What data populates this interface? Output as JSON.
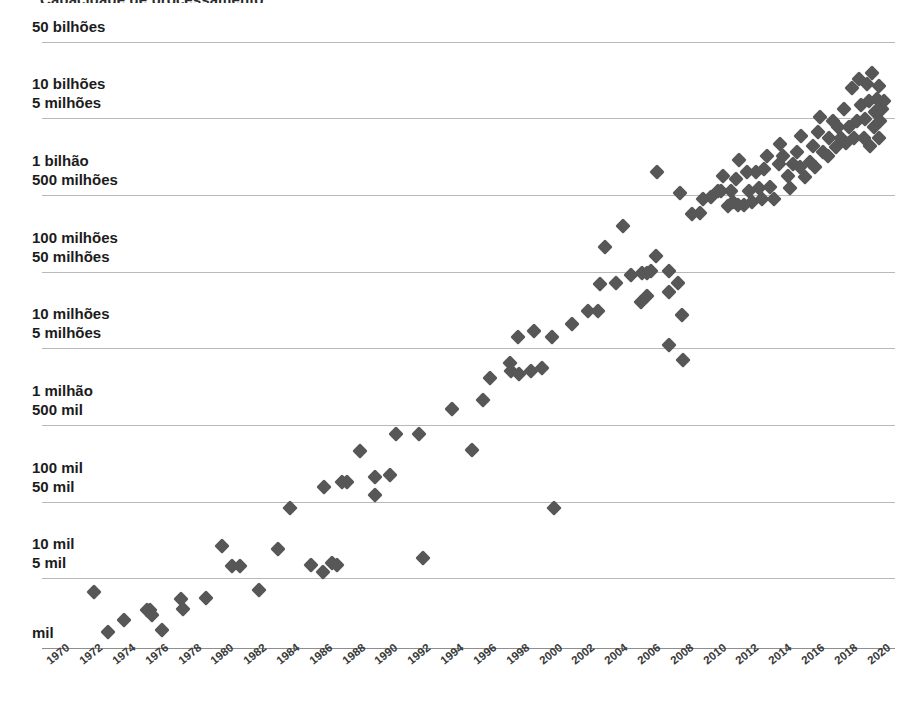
{
  "title": {
    "text": "Capacidade de processamento",
    "note": "partially-cropped-title-at-top-edge"
  },
  "colors": {
    "marker": "#575757",
    "gridline": "#b9b9b9",
    "axis": "#8e8e8e",
    "text": "#1c1c1c",
    "background": "#ffffff"
  },
  "axes": {
    "y_labels": [
      {
        "lines": [
          "50 bilhões"
        ],
        "y": 42
      },
      {
        "lines": [
          "10 bilhões",
          "5 milhões"
        ],
        "y": 118
      },
      {
        "lines": [
          "1 bilhão",
          "500 milhões"
        ],
        "y": 195
      },
      {
        "lines": [
          "100 milhões",
          "50 milhões"
        ],
        "y": 272
      },
      {
        "lines": [
          "10 milhões",
          "5 milhões"
        ],
        "y": 348
      },
      {
        "lines": [
          "1 milhão",
          "500 mil"
        ],
        "y": 425
      },
      {
        "lines": [
          "100 mil",
          "50 mil"
        ],
        "y": 502
      },
      {
        "lines": [
          "10 mil",
          "5 mil"
        ],
        "y": 578
      },
      {
        "lines": [
          "mil"
        ],
        "y": 648
      }
    ],
    "x_labels": [
      "1970",
      "1972",
      "1974",
      "1976",
      "1978",
      "1980",
      "1982",
      "1984",
      "1986",
      "1988",
      "1990",
      "1992",
      "1994",
      "1996",
      "1998",
      "2000",
      "2002",
      "2004",
      "2006",
      "2008",
      "2010",
      "2012",
      "2014",
      "2016",
      "2018",
      "2020"
    ]
  },
  "chart_data": {
    "type": "scatter",
    "title": "Capacidade de processamento",
    "xlabel": "",
    "ylabel": "",
    "log_scale_y": true,
    "xlim": [
      1969,
      2021
    ],
    "ylim": [
      1000,
      50000000000
    ],
    "grid": true,
    "legend": null,
    "y_tick_values": [
      50000000000,
      10000000000,
      1000000000,
      100000000,
      10000000,
      1000000,
      100000,
      10000,
      1000
    ],
    "y_tick_labels": [
      "50 bilhões",
      "10 bilhões / 5 milhões",
      "1 bilhão / 500 milhões",
      "100 milhões / 50 milhões",
      "10 milhões / 5 milhões",
      "1 milhão / 500 mil",
      "100 mil / 50 mil",
      "10 mil / 5 mil",
      "mil"
    ],
    "x_tick_labels": [
      "1970",
      "1972",
      "1974",
      "1976",
      "1978",
      "1980",
      "1982",
      "1984",
      "1986",
      "1988",
      "1990",
      "1992",
      "1994",
      "1996",
      "1998",
      "2000",
      "2002",
      "2004",
      "2006",
      "2008",
      "2010",
      "2012",
      "2014",
      "2016",
      "2018",
      "2020"
    ],
    "points": [
      {
        "x": 1972.2,
        "y": 5200
      },
      {
        "x": 1973.0,
        "y": 1600
      },
      {
        "x": 1974.0,
        "y": 2300
      },
      {
        "x": 1975.4,
        "y": 3000
      },
      {
        "x": 1975.6,
        "y": 3000
      },
      {
        "x": 1975.7,
        "y": 2600
      },
      {
        "x": 1976.3,
        "y": 1700
      },
      {
        "x": 1977.5,
        "y": 4200
      },
      {
        "x": 1977.6,
        "y": 3100
      },
      {
        "x": 1979.0,
        "y": 4300
      },
      {
        "x": 1980.0,
        "y": 20000
      },
      {
        "x": 1980.6,
        "y": 11000
      },
      {
        "x": 1981.1,
        "y": 11000
      },
      {
        "x": 1982.2,
        "y": 5500
      },
      {
        "x": 1983.4,
        "y": 18000
      },
      {
        "x": 1984.1,
        "y": 60000
      },
      {
        "x": 1985.4,
        "y": 11500
      },
      {
        "x": 1986.1,
        "y": 9200
      },
      {
        "x": 1986.7,
        "y": 12000
      },
      {
        "x": 1987.0,
        "y": 11500
      },
      {
        "x": 1986.2,
        "y": 110000
      },
      {
        "x": 1987.3,
        "y": 130000
      },
      {
        "x": 1987.6,
        "y": 130000
      },
      {
        "x": 1989.3,
        "y": 88000
      },
      {
        "x": 1989.3,
        "y": 150000
      },
      {
        "x": 1990.2,
        "y": 160000
      },
      {
        "x": 1988.4,
        "y": 320000
      },
      {
        "x": 1990.6,
        "y": 520000
      },
      {
        "x": 1992.0,
        "y": 530000
      },
      {
        "x": 1992.2,
        "y": 14000
      },
      {
        "x": 1994.0,
        "y": 1100000
      },
      {
        "x": 1995.2,
        "y": 330000
      },
      {
        "x": 1995.9,
        "y": 1400000
      },
      {
        "x": 1996.3,
        "y": 2700000
      },
      {
        "x": 1997.5,
        "y": 4200000
      },
      {
        "x": 1997.6,
        "y": 3300000
      },
      {
        "x": 1998.1,
        "y": 3000000
      },
      {
        "x": 1998.8,
        "y": 3300000
      },
      {
        "x": 1999.5,
        "y": 3600000
      },
      {
        "x": 1998.0,
        "y": 9000000
      },
      {
        "x": 1999.0,
        "y": 10500000
      },
      {
        "x": 2000.1,
        "y": 9000000
      },
      {
        "x": 2000.2,
        "y": 60000
      },
      {
        "x": 2001.3,
        "y": 13000000
      },
      {
        "x": 2002.3,
        "y": 19000000
      },
      {
        "x": 2002.9,
        "y": 19000000
      },
      {
        "x": 2003.0,
        "y": 42000000
      },
      {
        "x": 2004.0,
        "y": 43000000
      },
      {
        "x": 2003.3,
        "y": 125000000
      },
      {
        "x": 2004.4,
        "y": 230000000
      },
      {
        "x": 2004.9,
        "y": 55000000
      },
      {
        "x": 2005.6,
        "y": 58000000
      },
      {
        "x": 2005.5,
        "y": 25000000
      },
      {
        "x": 2005.9,
        "y": 30000000
      },
      {
        "x": 2005.9,
        "y": 58000000
      },
      {
        "x": 2006.1,
        "y": 62000000
      },
      {
        "x": 2006.4,
        "y": 95000000
      },
      {
        "x": 2006.5,
        "y": 1100000000
      },
      {
        "x": 2007.2,
        "y": 62000000
      },
      {
        "x": 2007.2,
        "y": 33000000
      },
      {
        "x": 2007.2,
        "y": 7000000
      },
      {
        "x": 2007.8,
        "y": 44000000
      },
      {
        "x": 2008.0,
        "y": 17000000
      },
      {
        "x": 2008.1,
        "y": 4500000
      },
      {
        "x": 2007.9,
        "y": 600000000
      },
      {
        "x": 2008.6,
        "y": 330000000
      },
      {
        "x": 2009.1,
        "y": 340000000
      },
      {
        "x": 2009.3,
        "y": 500000000
      },
      {
        "x": 2009.8,
        "y": 530000000
      },
      {
        "x": 2010.2,
        "y": 640000000
      },
      {
        "x": 2010.4,
        "y": 640000000
      },
      {
        "x": 2010.5,
        "y": 1000000000
      },
      {
        "x": 2010.8,
        "y": 410000000
      },
      {
        "x": 2011.0,
        "y": 640000000
      },
      {
        "x": 2011.1,
        "y": 460000000
      },
      {
        "x": 2011.3,
        "y": 900000000
      },
      {
        "x": 2011.4,
        "y": 430000000
      },
      {
        "x": 2011.5,
        "y": 1600000000
      },
      {
        "x": 2011.8,
        "y": 430000000
      },
      {
        "x": 2012.0,
        "y": 1100000000
      },
      {
        "x": 2012.1,
        "y": 640000000
      },
      {
        "x": 2012.3,
        "y": 460000000
      },
      {
        "x": 2012.5,
        "y": 1100000000
      },
      {
        "x": 2012.7,
        "y": 700000000
      },
      {
        "x": 2012.9,
        "y": 500000000
      },
      {
        "x": 2013.0,
        "y": 1200000000
      },
      {
        "x": 2013.2,
        "y": 1800000000
      },
      {
        "x": 2013.4,
        "y": 720000000
      },
      {
        "x": 2013.6,
        "y": 500000000
      },
      {
        "x": 2013.9,
        "y": 1400000000
      },
      {
        "x": 2014.0,
        "y": 2500000000
      },
      {
        "x": 2014.2,
        "y": 1800000000
      },
      {
        "x": 2014.5,
        "y": 1000000000
      },
      {
        "x": 2014.6,
        "y": 700000000
      },
      {
        "x": 2014.8,
        "y": 1400000000
      },
      {
        "x": 2015.0,
        "y": 2000000000
      },
      {
        "x": 2015.2,
        "y": 1300000000
      },
      {
        "x": 2015.3,
        "y": 3200000000
      },
      {
        "x": 2015.5,
        "y": 950000000
      },
      {
        "x": 2015.8,
        "y": 1500000000
      },
      {
        "x": 2016.0,
        "y": 2400000000
      },
      {
        "x": 2016.1,
        "y": 1300000000
      },
      {
        "x": 2016.3,
        "y": 3600000000
      },
      {
        "x": 2016.4,
        "y": 5500000000
      },
      {
        "x": 2016.6,
        "y": 2000000000
      },
      {
        "x": 2016.9,
        "y": 1800000000
      },
      {
        "x": 2017.0,
        "y": 3000000000
      },
      {
        "x": 2017.2,
        "y": 5000000000
      },
      {
        "x": 2017.4,
        "y": 2300000000
      },
      {
        "x": 2017.5,
        "y": 4200000000
      },
      {
        "x": 2017.7,
        "y": 3000000000
      },
      {
        "x": 2017.9,
        "y": 7000000000
      },
      {
        "x": 2018.0,
        "y": 2600000000
      },
      {
        "x": 2018.2,
        "y": 4200000000
      },
      {
        "x": 2018.4,
        "y": 13000000000
      },
      {
        "x": 2018.5,
        "y": 3000000000
      },
      {
        "x": 2018.7,
        "y": 5000000000
      },
      {
        "x": 2018.9,
        "y": 8000000000
      },
      {
        "x": 2019.1,
        "y": 3000000000
      },
      {
        "x": 2019.2,
        "y": 5200000000
      },
      {
        "x": 2019.4,
        "y": 9000000000
      },
      {
        "x": 2019.5,
        "y": 2400000000
      },
      {
        "x": 2019.7,
        "y": 4200000000
      },
      {
        "x": 2019.8,
        "y": 6500000000
      },
      {
        "x": 2019.9,
        "y": 9500000000
      },
      {
        "x": 2020.0,
        "y": 3000000000
      },
      {
        "x": 2020.1,
        "y": 5000000000
      },
      {
        "x": 2020.2,
        "y": 7000000000
      },
      {
        "x": 2020.3,
        "y": 9000000000
      },
      {
        "x": 2020.0,
        "y": 14000000000
      },
      {
        "x": 2019.6,
        "y": 20000000000
      },
      {
        "x": 2018.8,
        "y": 17000000000
      },
      {
        "x": 2019.3,
        "y": 14500000000
      }
    ]
  }
}
